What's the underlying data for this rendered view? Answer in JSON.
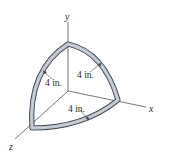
{
  "figure": {
    "axes": {
      "x_label": "x",
      "y_label": "y",
      "z_label": "z"
    },
    "dimensions": [
      {
        "id": "yz-arc-radius",
        "label": "4 in."
      },
      {
        "id": "xy-arc-radius",
        "label": "4 in."
      },
      {
        "id": "xz-arc-radius",
        "label": "4 in."
      }
    ],
    "colors": {
      "tube_fill": "#b9c0cc",
      "tube_outline": "#3d4452",
      "axis_line": "#555555",
      "text": "#2a2a2a"
    }
  }
}
